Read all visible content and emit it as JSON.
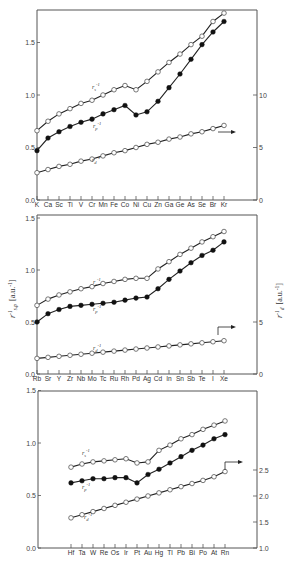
{
  "chart_data": [
    {
      "type": "line",
      "title": "",
      "panel": "4th period (K–Kr)",
      "categories": [
        "K",
        "Ca",
        "Sc",
        "Ti",
        "V",
        "Cr",
        "Mn",
        "Fe",
        "Co",
        "Ni",
        "Cu",
        "Zn",
        "Ga",
        "Ge",
        "As",
        "Se",
        "Br",
        "Kr"
      ],
      "left_axis": {
        "ticks": [
          "0.0",
          "0.5",
          "1.0",
          "1.5"
        ],
        "ylim": [
          0,
          1.8
        ]
      },
      "right_axis": {
        "ticks": [
          "0",
          "5",
          "10"
        ],
        "ylim": [
          0,
          18
        ]
      },
      "series": [
        {
          "name": "r_s^-1",
          "marker": "open",
          "axis": "left",
          "values": [
            0.66,
            0.75,
            0.82,
            0.87,
            0.92,
            0.95,
            1.0,
            1.05,
            1.09,
            1.05,
            1.13,
            1.22,
            1.31,
            1.39,
            1.48,
            1.56,
            1.7,
            1.78
          ]
        },
        {
          "name": "r_p^-1",
          "marker": "filled",
          "axis": "left",
          "values": [
            0.47,
            0.59,
            0.65,
            0.7,
            0.74,
            0.77,
            0.82,
            0.86,
            0.9,
            0.81,
            0.84,
            0.94,
            1.07,
            1.2,
            1.34,
            1.48,
            1.6,
            1.7
          ]
        },
        {
          "name": "r_d^-1",
          "marker": "open",
          "axis": "right",
          "values": [
            2.6,
            2.9,
            3.2,
            3.4,
            3.7,
            3.9,
            4.2,
            4.5,
            4.7,
            5.0,
            5.3,
            5.5,
            5.8,
            6.0,
            6.3,
            6.5,
            6.8,
            7.1
          ]
        }
      ]
    },
    {
      "type": "line",
      "title": "",
      "panel": "5th period (Rb–Xe)",
      "categories": [
        "Rb",
        "Sr",
        "Y",
        "Zr",
        "Nb",
        "Mo",
        "Tc",
        "Ru",
        "Rh",
        "Pd",
        "Ag",
        "Cd",
        "In",
        "Sn",
        "Sb",
        "Te",
        "I",
        "Xe"
      ],
      "ylabel": "r_s,p^-1 [a.u.^-1]",
      "ylabel_right": "r_d^-1 [a.u.^-1]",
      "left_axis": {
        "ticks": [
          "0.0",
          "0.5",
          "1.0",
          "1.5"
        ],
        "ylim": [
          0,
          1.5
        ]
      },
      "right_axis": {
        "ticks": [
          "0",
          "5"
        ],
        "ylim": [
          0,
          14.4
        ]
      },
      "series": [
        {
          "name": "r_s^-1",
          "marker": "open",
          "axis": "left",
          "values": [
            0.66,
            0.72,
            0.76,
            0.79,
            0.82,
            0.84,
            0.87,
            0.89,
            0.91,
            0.92,
            0.92,
            1.01,
            1.08,
            1.15,
            1.21,
            1.27,
            1.32,
            1.37
          ]
        },
        {
          "name": "r_p^-1",
          "marker": "filled",
          "axis": "left",
          "values": [
            0.5,
            0.58,
            0.62,
            0.65,
            0.66,
            0.67,
            0.68,
            0.69,
            0.71,
            0.73,
            0.74,
            0.82,
            0.91,
            0.99,
            1.07,
            1.14,
            1.19,
            1.27
          ]
        },
        {
          "name": "r_d^-1",
          "marker": "open",
          "axis": "right",
          "values": [
            1.5,
            1.6,
            1.7,
            1.8,
            1.9,
            2.0,
            2.1,
            2.2,
            2.3,
            2.4,
            2.5,
            2.6,
            2.7,
            2.8,
            2.9,
            3.0,
            3.1,
            3.2
          ]
        }
      ]
    },
    {
      "type": "line",
      "title": "",
      "panel": "6th period (Hf–Rn)",
      "categories": [
        "Hf",
        "Ta",
        "W",
        "Re",
        "Os",
        "Ir",
        "Pt",
        "Au",
        "Hg",
        "Tl",
        "Pb",
        "Bi",
        "Po",
        "At",
        "Rn"
      ],
      "left_axis": {
        "ticks": [
          "0.0",
          "0.5",
          "1.0",
          "1.5"
        ],
        "ylim": [
          0,
          1.5
        ]
      },
      "right_axis": {
        "ticks": [
          "1.0",
          "1.5",
          "2.0",
          "2.5"
        ],
        "ylim": [
          1.0,
          3.9
        ]
      },
      "series": [
        {
          "name": "r_s^-1",
          "marker": "open",
          "axis": "left",
          "values": [
            0.77,
            0.8,
            0.82,
            0.83,
            0.84,
            0.85,
            0.81,
            0.82,
            0.93,
            0.98,
            1.04,
            1.08,
            1.13,
            1.17,
            1.21
          ]
        },
        {
          "name": "r_p^-1",
          "marker": "filled",
          "axis": "left",
          "values": [
            0.62,
            0.64,
            0.66,
            0.66,
            0.67,
            0.67,
            0.62,
            0.7,
            0.75,
            0.81,
            0.87,
            0.93,
            0.98,
            1.04,
            1.08
          ]
        },
        {
          "name": "r_d^-1",
          "marker": "open",
          "axis": "right",
          "values": [
            1.58,
            1.64,
            1.7,
            1.76,
            1.82,
            1.88,
            1.94,
            2.0,
            2.06,
            2.12,
            2.18,
            2.24,
            2.3,
            2.37,
            2.47
          ]
        }
      ]
    }
  ],
  "labels": {
    "rs": "r",
    "rs_sub": "s",
    "rp": "r",
    "rp_sub": "p",
    "rd": "r",
    "rd_sub": "d",
    "sup": "-1",
    "ylabel_left": "r",
    "ylabel_left_sub": "s,p",
    "ylabel_left_unit": "[a.u.",
    "ylabel_right": "r",
    "ylabel_right_sub": "d",
    "ylabel_right_unit": "[a.u.",
    "unit_sup": "-1",
    "unit_close": "]"
  }
}
